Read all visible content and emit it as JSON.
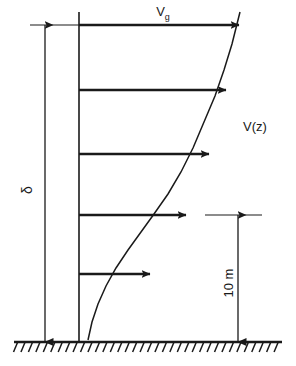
{
  "diagram": {
    "labels": {
      "gradient_velocity": "V",
      "gradient_velocity_subscript": "g",
      "profile_function": "V(z)",
      "boundary_layer_depth": "δ",
      "reference_height": "10 m"
    },
    "icons": {
      "ground_hatch": "ground-hatch-icon",
      "arrow_head": "arrow-head-icon"
    },
    "colors": {
      "ink": "#1a1a1a",
      "background": "#ffffff"
    }
  },
  "chart_data": {
    "type": "line",
    "xlabel": "V(z)",
    "ylabel": "δ",
    "grid": false,
    "legend": "none",
    "annotations": [
      {
        "text": "V",
        "subscript": "g",
        "role": "gradient-wind-speed-label",
        "x": 168,
        "y": 14
      },
      {
        "text": "V(z)",
        "role": "velocity-profile-label",
        "x": 243,
        "y": 131
      },
      {
        "text": "δ",
        "role": "boundary-layer-depth-label",
        "x": 32,
        "y": 190,
        "rotated": true
      },
      {
        "text": "10 m",
        "role": "reference-height-label",
        "x": 233,
        "y": 283,
        "rotated": true
      }
    ],
    "axis": {
      "x": 79,
      "y_top": 12,
      "y_bottom": 342
    },
    "ground": {
      "y": 342,
      "x_start": 14,
      "x_end": 282,
      "hatch_count": 36,
      "hatch_length": 10
    },
    "curve": {
      "name": "power-law velocity profile",
      "points": [
        [
          88,
          340
        ],
        [
          92,
          322
        ],
        [
          98,
          304
        ],
        [
          106,
          286
        ],
        [
          116,
          268
        ],
        [
          128,
          250
        ],
        [
          141,
          232
        ],
        [
          154,
          214
        ],
        [
          168,
          194
        ],
        [
          181,
          172
        ],
        [
          193,
          148
        ],
        [
          204,
          122
        ],
        [
          215,
          96
        ],
        [
          224,
          70
        ],
        [
          232,
          44
        ],
        [
          240,
          12
        ]
      ]
    },
    "velocity_arrows": [
      {
        "index": 1,
        "y": 25,
        "x_start": 79,
        "x_end": 239,
        "length": 160
      },
      {
        "index": 2,
        "y": 90,
        "x_start": 79,
        "x_end": 226,
        "length": 147
      },
      {
        "index": 3,
        "y": 154,
        "x_start": 79,
        "x_end": 209,
        "length": 130
      },
      {
        "index": 4,
        "y": 215,
        "x_start": 79,
        "x_end": 186,
        "length": 107
      },
      {
        "index": 5,
        "y": 274,
        "x_start": 79,
        "x_end": 150,
        "length": 71
      }
    ],
    "dimensions": [
      {
        "name": "boundary-layer-depth",
        "label": "δ",
        "orientation": "vertical",
        "x": 45,
        "y_top": 25,
        "y_bottom": 342,
        "extension_line": {
          "y": 25,
          "x_start": 30,
          "x_end": 79
        }
      },
      {
        "name": "reference-height",
        "label": "10 m",
        "orientation": "vertical",
        "x": 238,
        "y_top": 215,
        "y_bottom": 342,
        "extension_line": {
          "y": 215,
          "x_start": 205,
          "x_end": 262
        }
      }
    ]
  }
}
